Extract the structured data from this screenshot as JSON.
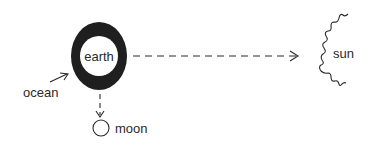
{
  "diagram": {
    "nodes": {
      "earth": {
        "label": "earth"
      },
      "sun": {
        "label": "sun"
      },
      "moon": {
        "label": "moon"
      },
      "ocean": {
        "label": "ocean"
      }
    },
    "edges": [
      {
        "from": "earth",
        "to": "sun",
        "style": "dashed",
        "arrow": "open"
      },
      {
        "from": "earth",
        "to": "moon",
        "style": "dashed",
        "arrow": "open"
      },
      {
        "from": "ocean",
        "to": "earth",
        "style": "solid",
        "arrow": "open"
      }
    ],
    "colors": {
      "ink": "#1f1f1f",
      "background": "#ffffff"
    }
  }
}
